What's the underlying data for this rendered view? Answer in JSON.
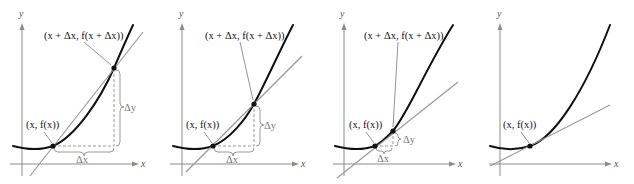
{
  "figure": {
    "panels": [
      {
        "id": "panel-1",
        "axis_x_label": "x",
        "axis_y_label": "y",
        "point_lower_label": "(x, f(x))",
        "point_upper_label": "(x + Δx, f(x + Δx))",
        "delta_x_label": "Δx",
        "delta_y_label": "Δy",
        "line_type": "secant"
      },
      {
        "id": "panel-2",
        "axis_x_label": "x",
        "axis_y_label": "y",
        "point_lower_label": "(x, f(x))",
        "point_upper_label": "(x + Δx, f(x + Δx))",
        "delta_x_label": "Δx",
        "delta_y_label": "Δy",
        "line_type": "secant"
      },
      {
        "id": "panel-3",
        "axis_x_label": "x",
        "axis_y_label": "y",
        "point_lower_label": "(x, f(x))",
        "point_upper_label": "(x + Δx, f(x + Δx))",
        "delta_x_label": "Δx",
        "delta_y_label": "Δy",
        "line_type": "secant"
      },
      {
        "id": "panel-4",
        "axis_x_label": "x",
        "axis_y_label": "y",
        "point_lower_label": "(x, f(x))",
        "line_type": "tangent"
      }
    ],
    "colors": {
      "curve": "#111111",
      "secant": "#9a9a9a",
      "axis": "#8c8c8c",
      "background": "#ffffff"
    }
  }
}
